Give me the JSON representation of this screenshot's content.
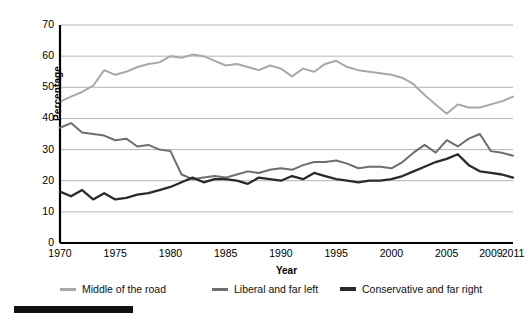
{
  "axes": {
    "y_title": "Percentage",
    "x_title": "Year",
    "y_ticks": [
      "0",
      "10",
      "20",
      "30",
      "40",
      "50",
      "60",
      "70"
    ],
    "x_ticks": [
      "1970",
      "1975",
      "1980",
      "1985",
      "1990",
      "1995",
      "2000",
      "2005",
      "2009",
      "2011"
    ]
  },
  "legend": {
    "items": [
      {
        "label": "Middle of the road",
        "color": "#a8a8a8"
      },
      {
        "label": "Liberal and far left",
        "color": "#6e6e6e"
      },
      {
        "label": "Conservative and far right",
        "color": "#2a2a2a"
      }
    ]
  },
  "chart_data": {
    "type": "line",
    "title": "",
    "xlabel": "Year",
    "ylabel": "Percentage",
    "xlim": [
      1970,
      2011
    ],
    "ylim": [
      0,
      70
    ],
    "grid": true,
    "legend_position": "bottom",
    "x": [
      1970,
      1971,
      1972,
      1973,
      1974,
      1975,
      1976,
      1977,
      1978,
      1979,
      1980,
      1981,
      1982,
      1983,
      1984,
      1985,
      1986,
      1987,
      1988,
      1989,
      1990,
      1991,
      1992,
      1993,
      1994,
      1995,
      1996,
      1997,
      1998,
      1999,
      2000,
      2001,
      2002,
      2003,
      2004,
      2005,
      2006,
      2007,
      2008,
      2009,
      2010,
      2011
    ],
    "series": [
      {
        "name": "Middle of the road",
        "color": "#a8a8a8",
        "values": [
          45.4,
          47.0,
          48.5,
          50.5,
          55.5,
          54.0,
          55.0,
          56.5,
          57.5,
          58.0,
          60.0,
          59.5,
          60.5,
          60.0,
          58.5,
          57.0,
          57.5,
          56.5,
          55.5,
          57.0,
          56.0,
          53.5,
          56.0,
          55.0,
          57.5,
          58.5,
          56.5,
          55.5,
          55.0,
          54.5,
          54.0,
          53.0,
          51.0,
          47.5,
          44.5,
          41.5,
          44.5,
          43.5,
          43.5,
          44.5,
          45.5,
          47.0
        ]
      },
      {
        "name": "Liberal and far left",
        "color": "#6e6e6e",
        "values": [
          37.0,
          38.5,
          35.5,
          35.0,
          34.5,
          33.0,
          33.5,
          31.0,
          31.5,
          30.0,
          29.5,
          22.0,
          20.5,
          21.0,
          21.5,
          21.0,
          22.0,
          23.0,
          22.5,
          23.5,
          24.0,
          23.5,
          25.0,
          26.0,
          26.0,
          26.5,
          25.5,
          24.0,
          24.5,
          24.5,
          24.0,
          26.0,
          29.0,
          31.5,
          29.0,
          33.0,
          31.0,
          33.5,
          35.0,
          29.5,
          29.0,
          28.0
        ]
      },
      {
        "name": "Conservative and far right",
        "color": "#2a2a2a",
        "values": [
          16.5,
          15.0,
          17.0,
          14.0,
          16.0,
          14.0,
          14.5,
          15.5,
          16.0,
          17.0,
          18.0,
          19.5,
          21.0,
          19.5,
          20.5,
          20.5,
          20.0,
          19.0,
          21.0,
          20.5,
          20.0,
          21.5,
          20.5,
          22.5,
          21.5,
          20.5,
          20.0,
          19.5,
          20.0,
          20.0,
          20.5,
          21.5,
          23.0,
          24.5,
          26.0,
          27.0,
          28.5,
          25.0,
          23.0,
          22.5,
          22.0,
          21.0
        ]
      }
    ]
  }
}
